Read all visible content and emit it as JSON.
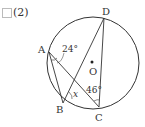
{
  "problem": {
    "number_label": "(2)"
  },
  "diagram": {
    "points": {
      "A": {
        "label": "A",
        "x": 49,
        "y": 52
      },
      "B": {
        "label": "B",
        "x": 63,
        "y": 103
      },
      "C": {
        "label": "C",
        "x": 99,
        "y": 107
      },
      "D": {
        "label": "D",
        "x": 104,
        "y": 18
      },
      "O": {
        "label": "O",
        "x": 92,
        "y": 62
      }
    },
    "circle": {
      "cx": 93,
      "cy": 63,
      "r": 46
    },
    "angles": {
      "at_A": "24°",
      "at_C": "46°",
      "unknown": "x"
    }
  }
}
